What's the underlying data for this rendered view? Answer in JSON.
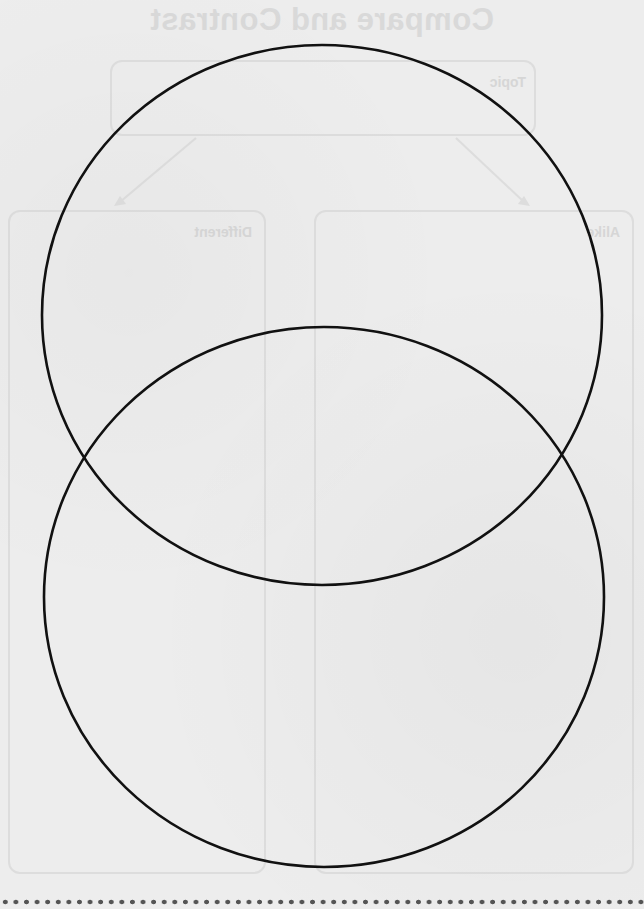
{
  "worksheet": {
    "bleed_through": {
      "title": "Compare and Contrast",
      "topic_label": "Topic",
      "different_label": "Different",
      "alike_label": "Alike",
      "mirrored": true
    },
    "venn": {
      "circle_count": 2,
      "orientation": "vertical",
      "stroke_color": "#111111",
      "top_circle": {
        "cx": 322,
        "cy": 315,
        "rx": 280,
        "ry": 270
      },
      "bottom_circle": {
        "cx": 324,
        "cy": 597,
        "rx": 280,
        "ry": 270
      }
    },
    "cut_line": {
      "style": "dotted",
      "color": "#555555"
    },
    "colors": {
      "paper": "#ededed",
      "faint_print": "#c9c9c9"
    }
  }
}
